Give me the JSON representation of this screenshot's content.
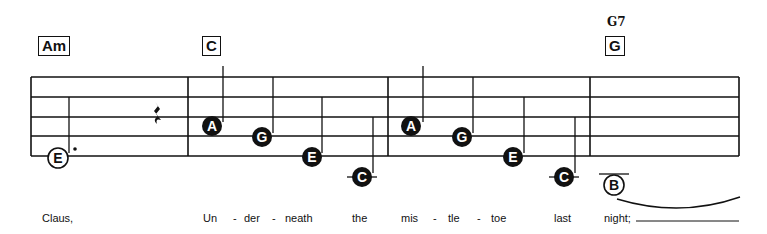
{
  "chords": [
    {
      "label": "Am",
      "x": 38,
      "y": 36
    },
    {
      "label": "C",
      "x": 202,
      "y": 36
    },
    {
      "label": "G",
      "x": 605,
      "y": 36,
      "above": "G7"
    }
  ],
  "staff": {
    "left": 31,
    "right": 739,
    "lines": [
      77,
      97,
      117,
      136,
      156
    ],
    "barlines": [
      188,
      388,
      590
    ]
  },
  "notes": [
    {
      "letter": "E",
      "x": 58,
      "y": 158,
      "style": "open",
      "dotted": true
    },
    {
      "letter": "A",
      "x": 212,
      "y": 126,
      "style": "filled"
    },
    {
      "letter": "G",
      "x": 262,
      "y": 137,
      "style": "filled"
    },
    {
      "letter": "E",
      "x": 312,
      "y": 157,
      "style": "filled"
    },
    {
      "letter": "C",
      "x": 362,
      "y": 177,
      "style": "filled",
      "ledger": true
    },
    {
      "letter": "A",
      "x": 411,
      "y": 126,
      "style": "filled"
    },
    {
      "letter": "G",
      "x": 462,
      "y": 137,
      "style": "filled"
    },
    {
      "letter": "E",
      "x": 513,
      "y": 157,
      "style": "filled"
    },
    {
      "letter": "C",
      "x": 564,
      "y": 177,
      "style": "filled",
      "ledger": true
    },
    {
      "letter": "B",
      "x": 614,
      "y": 185,
      "style": "open",
      "ledger": true
    }
  ],
  "lyrics": [
    {
      "text": "Claus,",
      "x": 42
    },
    {
      "text": "Un",
      "x": 203
    },
    {
      "text": "-",
      "x": 233
    },
    {
      "text": "der",
      "x": 244
    },
    {
      "text": "-",
      "x": 272
    },
    {
      "text": "neath",
      "x": 285
    },
    {
      "text": "the",
      "x": 352
    },
    {
      "text": "mis",
      "x": 401
    },
    {
      "text": "-",
      "x": 433
    },
    {
      "text": "tle",
      "x": 448
    },
    {
      "text": "-",
      "x": 477
    },
    {
      "text": "toe",
      "x": 491
    },
    {
      "text": "last",
      "x": 554
    },
    {
      "text": "night;",
      "x": 604
    }
  ]
}
